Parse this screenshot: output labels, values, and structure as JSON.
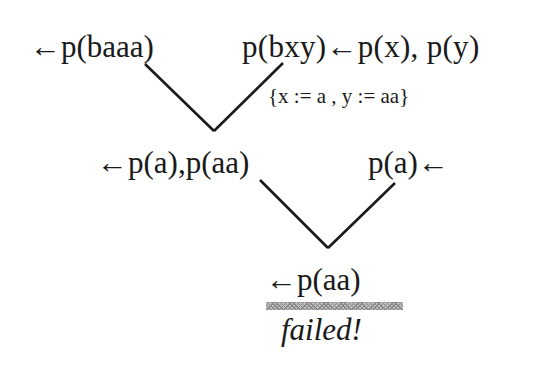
{
  "diagram": {
    "type": "resolution-derivation-tree",
    "nodes": {
      "goal": "←p(baaa)",
      "clause1": "p(bxy)←p(x), p(y)",
      "unifier": "{x := a , y := aa}",
      "resolvent1": "←p(a),p(aa)",
      "fact": "p(a)←",
      "resolvent2": "←p(aa)",
      "result": "failed!"
    },
    "edges": [
      {
        "from": "goal",
        "to": "resolvent1"
      },
      {
        "from": "clause1",
        "to": "resolvent1",
        "label": "unifier"
      },
      {
        "from": "resolvent1",
        "to": "resolvent2"
      },
      {
        "from": "fact",
        "to": "resolvent2"
      }
    ],
    "colors": {
      "text": "#1a1a1a",
      "line": "#1a1a1a",
      "hatch": "#8a8a8a",
      "background": "#ffffff"
    }
  }
}
